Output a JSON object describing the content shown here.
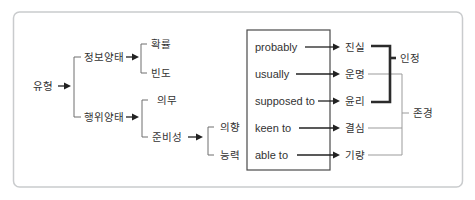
{
  "colors": {
    "bg": "#ffffff",
    "border": "#c9cbcd",
    "line": "#6e6e6e",
    "arrow": "#222222",
    "text": "#333333",
    "box": "#4a4a4a",
    "thick": "#2b2b2b",
    "thin": "#9b9b9b"
  },
  "diagram": {
    "root": "유형",
    "information_modality": {
      "label": "정보양태",
      "children": [
        "확률",
        "빈도"
      ]
    },
    "action_modality": {
      "label": "행위양태",
      "children": [
        "의무",
        "준비성"
      ]
    },
    "readiness_children": [
      "의향",
      "능력"
    ],
    "expressions": [
      "probably",
      "usually",
      "supposed to",
      "keen to",
      "able to"
    ],
    "meanings": [
      "진실",
      "운명",
      "윤리",
      "결심",
      "기량"
    ],
    "groups": {
      "acknowledgment": "인정",
      "respect": "존경"
    }
  }
}
